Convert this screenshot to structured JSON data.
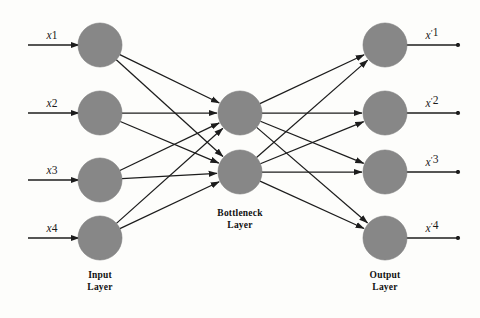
{
  "figure": {
    "type": "neural-network-diagram",
    "architecture": "autoencoder",
    "background_color": "#fdfdfb",
    "node_color": "#878787",
    "edge_color": "#1c1c1c"
  },
  "layers": {
    "input": {
      "caption_line1": "Input",
      "caption_line2": "Layer",
      "node_count": 4,
      "center_x": 100,
      "radius": 22,
      "node_y": [
        45,
        113,
        180,
        238
      ],
      "labels": [
        "x1",
        "x2",
        "x3",
        "x4"
      ],
      "label_base": "x",
      "label_indices": [
        "1",
        "2",
        "3",
        "4"
      ],
      "arrow_start_x": 28,
      "label_x": 52,
      "caption_x": 100,
      "caption_y1": 278,
      "caption_y2": 290
    },
    "bottleneck": {
      "caption_line1": "Bottleneck",
      "caption_line2": "Layer",
      "node_count": 2,
      "center_x": 240,
      "radius": 22,
      "node_y": [
        113,
        172
      ],
      "caption_x": 240,
      "caption_y1": 216,
      "caption_y2": 228
    },
    "output": {
      "caption_line1": "Output",
      "caption_line2": "Layer",
      "node_count": 4,
      "center_x": 385,
      "radius": 22,
      "node_y": [
        45,
        113,
        172,
        238
      ],
      "labels": [
        "x'1",
        "x'2",
        "x'3",
        "x'4"
      ],
      "label_base": "x",
      "label_prime": "′",
      "label_indices": [
        "1",
        "2",
        "3",
        "4"
      ],
      "arrow_end_x": 458,
      "label_x": 432,
      "caption_x": 385,
      "caption_y1": 278,
      "caption_y2": 290
    }
  },
  "connections": {
    "encoder_description": "fully-connected input to bottleneck",
    "decoder_description": "fully-connected bottleneck to output",
    "encoder_count": 8,
    "decoder_count": 8
  }
}
